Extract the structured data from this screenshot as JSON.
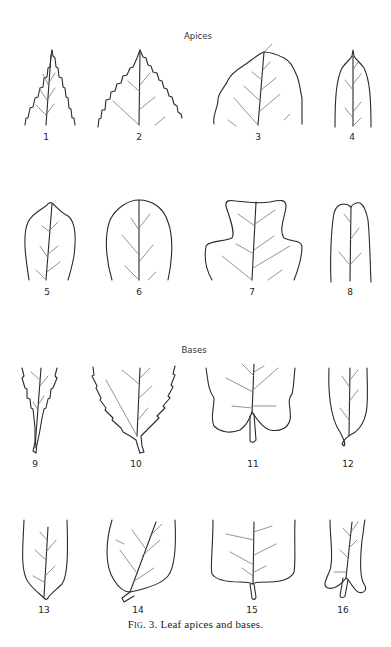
{
  "figure": {
    "sections": [
      {
        "title": "Apices",
        "labels": [
          "1",
          "2",
          "3",
          "4",
          "5",
          "6",
          "7",
          "8"
        ]
      },
      {
        "title": "Bases",
        "labels": [
          "9",
          "10",
          "11",
          "12",
          "13",
          "14",
          "15",
          "16"
        ]
      }
    ],
    "caption": {
      "prefix": "Fig. 3.",
      "text": " Leaf apices and bases."
    }
  },
  "colors": {
    "line": "#2a2a2a",
    "vein": "#777777",
    "background": "#ffffff"
  }
}
